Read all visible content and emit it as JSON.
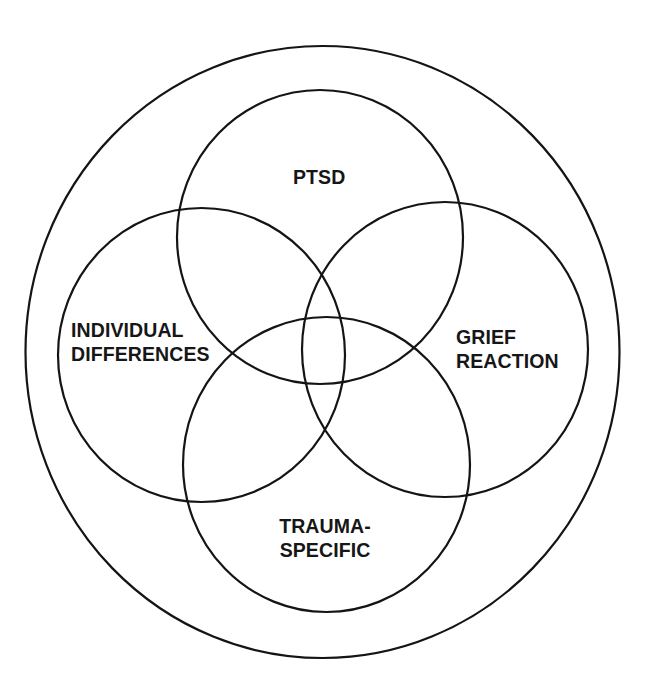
{
  "diagram": {
    "type": "venn",
    "stroke_color": "#141414",
    "background_color": "#ffffff",
    "outer_boundary": {
      "shape": "ellipse",
      "cx": 322.5,
      "cy": 352,
      "rx": 297,
      "ry": 306
    },
    "sets": [
      {
        "id": "ptsd",
        "label_lines": [
          "PTSD"
        ],
        "cx": 320,
        "cy": 237,
        "rx": 143,
        "ry": 147
      },
      {
        "id": "individual-differences",
        "label_lines": [
          "INDIVIDUAL",
          "DIFFERENCES"
        ],
        "cx": 201.5,
        "cy": 355,
        "rx": 143.5,
        "ry": 147
      },
      {
        "id": "grief-reaction",
        "label_lines": [
          "GRIEF",
          "REACTION"
        ],
        "cx": 445,
        "cy": 349.5,
        "rx": 143,
        "ry": 147.5
      },
      {
        "id": "trauma-specific",
        "label_lines": [
          "TRAUMA-",
          "SPECIFIC"
        ],
        "cx": 326.5,
        "cy": 464.5,
        "rx": 143.5,
        "ry": 147.5
      }
    ]
  }
}
